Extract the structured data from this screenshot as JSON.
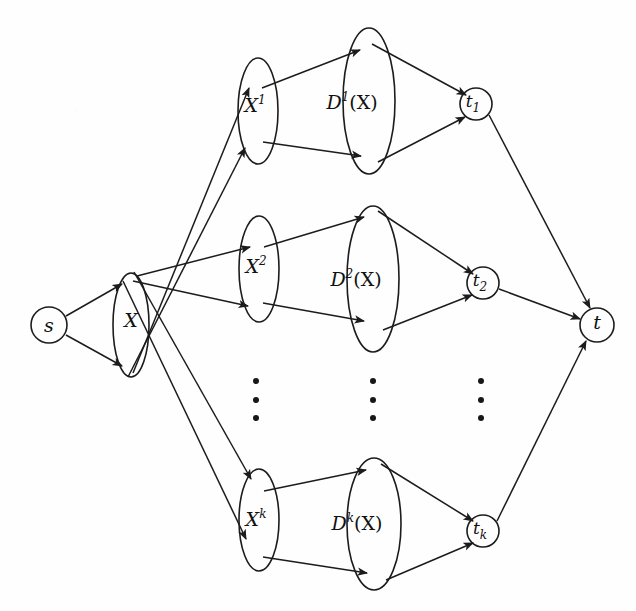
{
  "figure": {
    "type": "directed-graph-diagram",
    "background_color": "#fefefe",
    "stroke_color": "#1c1c1c"
  },
  "nodes": {
    "source": {
      "id": "s",
      "label": "s",
      "shape": "circle",
      "cx": 49,
      "cy": 325,
      "r": 18
    },
    "set_x": {
      "id": "X",
      "label": "X",
      "shape": "ellipse",
      "cx": 131,
      "cy": 325,
      "rx": 18,
      "ry": 52
    },
    "terminal": {
      "id": "t",
      "label": "t",
      "shape": "circle",
      "cx": 597,
      "cy": 325,
      "r": 17
    },
    "branches": [
      {
        "index": 1,
        "copy": {
          "base": "X",
          "sup": "1",
          "cx": 258,
          "cy": 111,
          "rx": 20,
          "ry": 53
        },
        "dist": {
          "base": "D",
          "sup": "1",
          "arg": "(X)",
          "cx": 369,
          "cy": 101,
          "rx": 26,
          "ry": 73
        },
        "sink": {
          "base": "t",
          "sub": "1",
          "cx": 476,
          "cy": 104,
          "r": 16
        }
      },
      {
        "index": 2,
        "copy": {
          "base": "X",
          "sup": "2",
          "cx": 259,
          "cy": 269,
          "rx": 20,
          "ry": 53
        },
        "dist": {
          "base": "D",
          "sup": "2",
          "arg": "(X)",
          "cx": 373,
          "cy": 279,
          "rx": 26,
          "ry": 73
        },
        "sink": {
          "base": "t",
          "sub": "2",
          "cx": 483,
          "cy": 283,
          "r": 16
        }
      },
      {
        "index": 3,
        "copy": {
          "base": "X",
          "sup": "k",
          "cx": 259,
          "cy": 520,
          "rx": 20,
          "ry": 51
        },
        "dist": {
          "base": "D",
          "sup": "k",
          "arg": "(X)",
          "cx": 374,
          "cy": 524,
          "rx": 27,
          "ry": 66
        },
        "sink": {
          "base": "t",
          "sub": "k",
          "cx": 483,
          "cy": 531,
          "r": 16
        }
      }
    ]
  },
  "ellipsis_columns": [
    {
      "name": "copy-column-ellipsis",
      "cx": 256,
      "dots_y": [
        381,
        400,
        418
      ]
    },
    {
      "name": "dist-column-ellipsis",
      "cx": 373,
      "dots_y": [
        381,
        400,
        418
      ]
    },
    {
      "name": "sink-column-ellipsis",
      "cx": 481,
      "dots_y": [
        381,
        400,
        418
      ]
    }
  ],
  "edges": [
    {
      "name": "s-to-X-upper",
      "from": "s",
      "to": "X"
    },
    {
      "name": "s-to-X-lower",
      "from": "s",
      "to": "X"
    },
    {
      "name": "X-top-to-X1-upper",
      "from": "X",
      "to": "X^1"
    },
    {
      "name": "X-bottom-to-X1-lower",
      "from": "X",
      "to": "X^1"
    },
    {
      "name": "X-top-to-X2-upper",
      "from": "X",
      "to": "X^2"
    },
    {
      "name": "X-bottom-to-X2-lower",
      "from": "X",
      "to": "X^2"
    },
    {
      "name": "X-top-to-Xk-upper",
      "from": "X",
      "to": "X^k"
    },
    {
      "name": "X-bottom-to-Xk-lower",
      "from": "X",
      "to": "X^k"
    },
    {
      "name": "X1-to-D1-upper",
      "from": "X^1",
      "to": "D^1(X)"
    },
    {
      "name": "X1-to-D1-lower",
      "from": "X^1",
      "to": "D^1(X)"
    },
    {
      "name": "D1-to-t1-upper",
      "from": "D^1(X)",
      "to": "t_1"
    },
    {
      "name": "D1-to-t1-lower",
      "from": "D^1(X)",
      "to": "t_1"
    },
    {
      "name": "X2-to-D2-upper",
      "from": "X^2",
      "to": "D^2(X)"
    },
    {
      "name": "X2-to-D2-lower",
      "from": "X^2",
      "to": "D^2(X)"
    },
    {
      "name": "D2-to-t2-upper",
      "from": "D^2(X)",
      "to": "t_2"
    },
    {
      "name": "D2-to-t2-lower",
      "from": "D^2(X)",
      "to": "t_2"
    },
    {
      "name": "Xk-to-Dk-upper",
      "from": "X^k",
      "to": "D^k(X)"
    },
    {
      "name": "Xk-to-Dk-lower",
      "from": "X^k",
      "to": "D^k(X)"
    },
    {
      "name": "Dk-to-tk-upper",
      "from": "D^k(X)",
      "to": "t_k"
    },
    {
      "name": "Dk-to-tk-lower",
      "from": "D^k(X)",
      "to": "t_k"
    },
    {
      "name": "t1-to-t",
      "from": "t_1",
      "to": "t"
    },
    {
      "name": "t2-to-t",
      "from": "t_2",
      "to": "t"
    },
    {
      "name": "tk-to-t",
      "from": "t_k",
      "to": "t"
    }
  ]
}
